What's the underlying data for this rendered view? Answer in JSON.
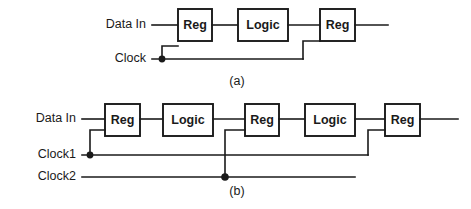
{
  "figure": {
    "background_color": "#ffffff",
    "line_color": "#1a1a1a",
    "box_fill_color": "#ffffff"
  },
  "panel_a": {
    "caption": "(a)",
    "signals": [
      {
        "name": "data-in",
        "label": "Data In"
      },
      {
        "name": "clock",
        "label": "Clock"
      }
    ],
    "blocks": [
      {
        "name": "reg-1",
        "label": "Reg"
      },
      {
        "name": "logic-1",
        "label": "Logic"
      },
      {
        "name": "reg-2",
        "label": "Reg"
      }
    ],
    "junction_count": 1
  },
  "panel_b": {
    "caption": "(b)",
    "signals": [
      {
        "name": "data-in",
        "label": "Data In"
      },
      {
        "name": "clock1",
        "label": "Clock1"
      },
      {
        "name": "clock2",
        "label": "Clock2"
      }
    ],
    "blocks": [
      {
        "name": "reg-1",
        "label": "Reg"
      },
      {
        "name": "logic-1",
        "label": "Logic"
      },
      {
        "name": "reg-2",
        "label": "Reg"
      },
      {
        "name": "logic-2",
        "label": "Logic"
      },
      {
        "name": "reg-3",
        "label": "Reg"
      }
    ],
    "junction_count": 2
  }
}
